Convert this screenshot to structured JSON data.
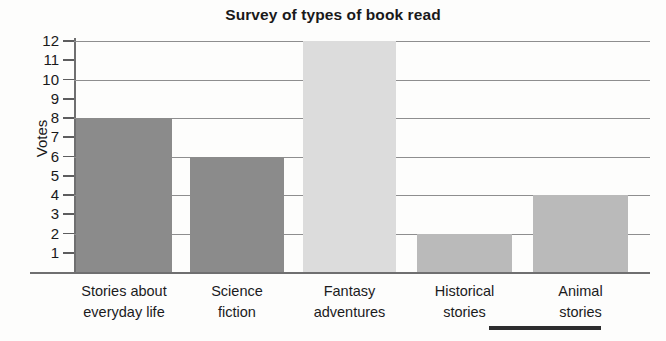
{
  "chart_data": {
    "type": "bar",
    "title": "Survey of types of book read",
    "xlabel": "",
    "ylabel": "Votes",
    "ylim": [
      0,
      12
    ],
    "ytick_values": [
      1,
      2,
      3,
      4,
      5,
      6,
      7,
      8,
      9,
      10,
      11,
      12
    ],
    "ytick_labels": [
      "1",
      "2",
      "3",
      "4",
      "5",
      "6",
      "7",
      "8",
      "9",
      "10",
      "11",
      "12"
    ],
    "gridline_values": [
      2,
      4,
      6,
      8,
      10,
      12
    ],
    "grid": true,
    "legend": false,
    "categories": [
      "Stories about everyday life",
      "Science fiction",
      "Fantasy adventures",
      "Historical stories",
      "Animal stories"
    ],
    "category_lines": [
      [
        "Stories about",
        "everyday life"
      ],
      [
        "Science",
        "fiction"
      ],
      [
        "Fantasy",
        "adventures"
      ],
      [
        "Historical",
        "stories"
      ],
      [
        "Animal",
        "stories"
      ]
    ],
    "values": [
      8,
      6,
      12,
      2,
      4
    ],
    "bar_colors": [
      "#8b8b8b",
      "#8b8b8b",
      "#dcdcdc",
      "#bababa",
      "#bababa"
    ]
  },
  "colors": {
    "axis": "#6f6f70",
    "grid": "#8e8e8f",
    "text": "#19191a",
    "background": "#fdfdfc",
    "bar_dark": "#8b8b8b",
    "bar_light": "#dcdcdc",
    "bar_mid": "#bababa"
  },
  "artifact": {
    "name": "scan-artifact-line"
  }
}
